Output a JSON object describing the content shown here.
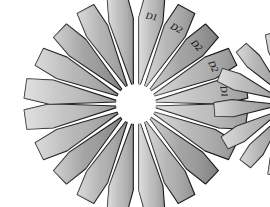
{
  "figure": {
    "title": "",
    "background_color": "#ffffff",
    "outline_color": "#1a1a1a",
    "hub_color": "#ffffff",
    "canvas": {
      "width": 270,
      "height": 207
    }
  },
  "diagram_data": {
    "type": "rosette-petal-diagram",
    "description": "Radial rosette of wedge-shaped petals arranged in four quadrant fans around a circular hub, with a second partially visible rosette at the right edge",
    "rosettes": [
      {
        "id": "rosette-main",
        "center_x": 136,
        "center_y": 104,
        "hub_radius": 20,
        "petal_count": 20,
        "quadrants": [
          {
            "id": "quadrant-top-right",
            "labels_visible": true,
            "petals": [
              {
                "index": 0,
                "label": "D1",
                "angle": -80,
                "length": 92,
                "fill": "#b8b8b8"
              },
              {
                "index": 1,
                "label": "D2",
                "angle": -62,
                "length": 88,
                "fill": "#adadad"
              },
              {
                "index": 2,
                "label": "D2",
                "angle": -44,
                "length": 86,
                "fill": "#9a9a9a"
              },
              {
                "index": 3,
                "label": "D2",
                "angle": -26,
                "length": 88,
                "fill": "#b0b0b0"
              },
              {
                "index": 4,
                "label": "D1",
                "angle": -8,
                "length": 92,
                "fill": "#bcbcbc"
              }
            ]
          },
          {
            "id": "quadrant-bottom-right",
            "labels_visible": false,
            "petals": [
              {
                "index": 0,
                "label": "",
                "angle": 8,
                "length": 92,
                "fill": "#bcbcbc"
              },
              {
                "index": 1,
                "label": "",
                "angle": 26,
                "length": 88,
                "fill": "#b0b0b0"
              },
              {
                "index": 2,
                "label": "",
                "angle": 44,
                "length": 86,
                "fill": "#9a9a9a"
              },
              {
                "index": 3,
                "label": "",
                "angle": 62,
                "length": 88,
                "fill": "#adadad"
              },
              {
                "index": 4,
                "label": "",
                "angle": 80,
                "length": 92,
                "fill": "#b8b8b8"
              }
            ]
          },
          {
            "id": "quadrant-bottom-left",
            "labels_visible": false,
            "petals": [
              {
                "index": 0,
                "label": "",
                "angle": 100,
                "length": 92,
                "fill": "#b8b8b8"
              },
              {
                "index": 1,
                "label": "",
                "angle": 118,
                "length": 88,
                "fill": "#adadad"
              },
              {
                "index": 2,
                "label": "",
                "angle": 136,
                "length": 86,
                "fill": "#9a9a9a"
              },
              {
                "index": 3,
                "label": "",
                "angle": 154,
                "length": 88,
                "fill": "#b0b0b0"
              },
              {
                "index": 4,
                "label": "",
                "angle": 172,
                "length": 92,
                "fill": "#bcbcbc"
              }
            ]
          },
          {
            "id": "quadrant-top-left",
            "labels_visible": false,
            "petals": [
              {
                "index": 0,
                "label": "",
                "angle": 188,
                "length": 92,
                "fill": "#bcbcbc"
              },
              {
                "index": 1,
                "label": "",
                "angle": 206,
                "length": 88,
                "fill": "#b0b0b0"
              },
              {
                "index": 2,
                "label": "",
                "angle": 224,
                "length": 86,
                "fill": "#9a9a9a"
              },
              {
                "index": 3,
                "label": "",
                "angle": 242,
                "length": 88,
                "fill": "#adadad"
              },
              {
                "index": 4,
                "label": "",
                "angle": 260,
                "length": 92,
                "fill": "#b8b8b8"
              }
            ]
          }
        ]
      },
      {
        "id": "rosette-secondary-clipped",
        "center_x": 292,
        "center_y": 104,
        "hub_radius": 14,
        "petal_count": 12,
        "clipped_at_right_edge": true,
        "quadrants": [
          {
            "id": "quadrant-left-clipped",
            "labels_visible": false,
            "petals": [
              {
                "index": 0,
                "label": "",
                "angle": 150,
                "length": 64,
                "fill": "#b4b4b4"
              },
              {
                "index": 1,
                "label": "",
                "angle": 176,
                "length": 64,
                "fill": "#a8a8a8"
              },
              {
                "index": 2,
                "label": "",
                "angle": 202,
                "length": 64,
                "fill": "#b4b4b4"
              },
              {
                "index": 3,
                "label": "",
                "angle": 228,
                "length": 62,
                "fill": "#ababab"
              },
              {
                "index": 4,
                "label": "",
                "angle": 254,
                "length": 60,
                "fill": "#b8b8b8"
              },
              {
                "index": 5,
                "label": "",
                "angle": 128,
                "length": 62,
                "fill": "#ababab"
              },
              {
                "index": 6,
                "label": "",
                "angle": 104,
                "length": 60,
                "fill": "#b8b8b8"
              }
            ]
          }
        ]
      }
    ],
    "labels": [
      "D1",
      "D2",
      "D2",
      "D2",
      "D1"
    ],
    "label_colors": {
      "text": "#000000"
    }
  }
}
